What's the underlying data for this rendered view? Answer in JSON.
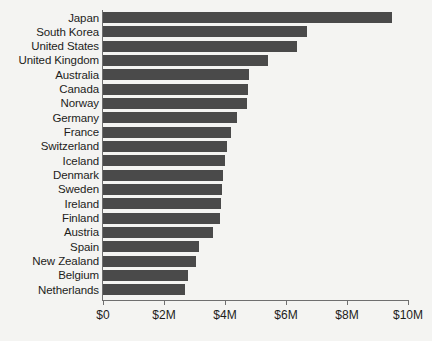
{
  "chart_data": {
    "type": "bar",
    "orientation": "horizontal",
    "title": "",
    "subtitle": "",
    "xlabel": "",
    "ylabel": "",
    "xlim": [
      0,
      10000000
    ],
    "grid": false,
    "legend": null,
    "bar_color": "#4a4a4a",
    "background_color": "#f4f4f2",
    "axis_color": "#6f6f6f",
    "text_color": "#1d1d1b",
    "value_unit": "USD",
    "value_suffix": "M",
    "xticks": [
      {
        "value": 0,
        "label": "$0"
      },
      {
        "value": 2000000,
        "label": "$2M"
      },
      {
        "value": 4000000,
        "label": "$4M"
      },
      {
        "value": 6000000,
        "label": "$6M"
      },
      {
        "value": 8000000,
        "label": "$8M"
      },
      {
        "value": 10000000,
        "label": "$10M"
      }
    ],
    "categories": [
      "Japan",
      "South Korea",
      "United States",
      "United Kingdom",
      "Australia",
      "Canada",
      "Norway",
      "Germany",
      "France",
      "Switzerland",
      "Iceland",
      "Denmark",
      "Sweden",
      "Ireland",
      "Finland",
      "Austria",
      "Spain",
      "New Zealand",
      "Belgium",
      "Netherlands"
    ],
    "values": [
      9480000,
      6700000,
      6350000,
      5400000,
      4800000,
      4750000,
      4720000,
      4400000,
      4200000,
      4050000,
      4000000,
      3950000,
      3900000,
      3880000,
      3850000,
      3600000,
      3150000,
      3050000,
      2800000,
      2700000
    ]
  }
}
